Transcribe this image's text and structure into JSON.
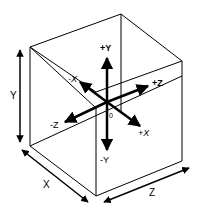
{
  "diagram": {
    "type": "3d-coordinate-cube",
    "axis_labels": {
      "plus_y": "+Y",
      "minus_y": "-Y",
      "plus_z": "+Z",
      "minus_z": "-Z",
      "plus_x": "+X",
      "minus_x": "-X",
      "origin": "0"
    },
    "dimension_labels": {
      "y": "Y",
      "x": "X",
      "z": "Z"
    },
    "colors": {
      "stroke": "#000000",
      "background": "#ffffff"
    }
  }
}
